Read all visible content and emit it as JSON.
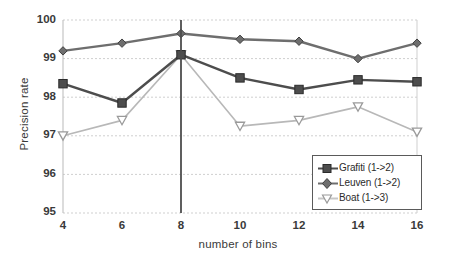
{
  "chart_data": {
    "type": "line",
    "title": "",
    "xlabel": "number of bins",
    "ylabel": "Precision rate",
    "x": [
      4,
      6,
      8,
      10,
      12,
      14,
      16
    ],
    "xtick_labels": [
      "4",
      "6",
      "8",
      "10",
      "12",
      "14",
      "16"
    ],
    "ytick_labels": [
      "100",
      "99",
      "98",
      "97",
      "96",
      "95"
    ],
    "yticks": [
      100,
      99,
      98,
      97,
      96,
      95
    ],
    "ylim": [
      95,
      100
    ],
    "xlim": [
      4,
      16
    ],
    "grid": true,
    "legend_position": "lower-right",
    "series": [
      {
        "name": "Grafiti (1->2)",
        "marker": "square",
        "color": "#4d4d4d",
        "values": [
          98.35,
          97.85,
          99.1,
          98.5,
          98.2,
          98.45,
          98.4
        ]
      },
      {
        "name": "Leuven (1->2)",
        "marker": "diamond",
        "color": "#6e6e6e",
        "values": [
          99.2,
          99.4,
          99.65,
          99.5,
          99.45,
          99.0,
          99.4
        ]
      },
      {
        "name": "Boat (1->3)",
        "marker": "triangle-down-open",
        "color": "#b8b8b8",
        "values": [
          97.0,
          97.4,
          99.1,
          97.25,
          97.4,
          97.75,
          97.1
        ]
      }
    ],
    "annotations": [
      {
        "type": "vertical-line",
        "x": 8,
        "label": "",
        "color": "#4d4d4d"
      }
    ]
  },
  "legend": {
    "items": [
      {
        "label": "Grafiti (1->2)",
        "marker": "square"
      },
      {
        "label": "Leuven (1->2)",
        "marker": "diamond"
      },
      {
        "label": "Boat (1->3)",
        "marker": "triangle-down-open"
      }
    ]
  },
  "colors": {
    "grafiti": "#4d4d4d",
    "leuven": "#6e6e6e",
    "boat": "#b8b8b8",
    "grid": "#cfcfcf",
    "axis": "#8a8a8a",
    "text": "#3a3a3a"
  }
}
